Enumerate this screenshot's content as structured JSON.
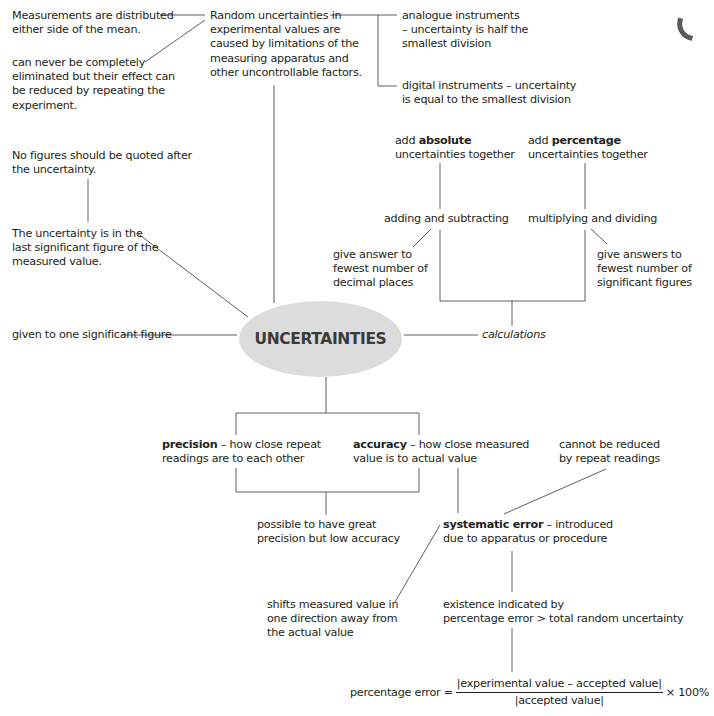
{
  "diagram": {
    "central_node": "UNCERTAINTIES",
    "top_left": {
      "distributed": [
        "Measurements are distributed",
        "either side of the mean."
      ],
      "never_eliminated": [
        "can never be completely",
        "eliminated but their effect can",
        "be reduced by repeating the",
        "experiment."
      ],
      "no_figures": [
        "No figures should be quoted after",
        "the uncertainty."
      ],
      "last_sig_fig": [
        "The uncertainty is in the",
        "last significant figure of the",
        "measured value."
      ],
      "one_sig_fig": "given to one significant figure"
    },
    "random": {
      "text": [
        "Random uncertainties in",
        "experimental values are",
        "caused by limitations of the",
        "measuring apparatus and",
        "other uncontrollable factors."
      ],
      "analogue": [
        "analogue instruments",
        "– uncertainty is half the",
        "smallest division"
      ],
      "digital": [
        "digital instruments – uncertainty",
        "is equal to the smallest division"
      ]
    },
    "calculations": {
      "label": "calculations",
      "absolute": {
        "pre": "add ",
        "bold": "absolute",
        "rest": "uncertainties together"
      },
      "percentage": {
        "pre": "add ",
        "bold": "percentage",
        "rest": "uncertainties together"
      },
      "adding": "adding and subtracting",
      "multiplying": "multiplying and dividing",
      "decimal_places": [
        "give answer to",
        "fewest number of",
        "decimal places"
      ],
      "sig_figs": [
        "give answers to",
        "fewest number of",
        "significant figures"
      ]
    },
    "precision": {
      "bold": "precision",
      "rest": " – how close repeat",
      "line2": "readings are to each other"
    },
    "accuracy": {
      "bold": "accuracy",
      "rest": " – how close measured",
      "line2": "value is to actual value"
    },
    "great_precision": [
      "possible to have great",
      "precision but low accuracy"
    ],
    "cannot_reduce": [
      "cannot be reduced",
      "by repeat readings"
    ],
    "systematic": {
      "bold": "systematic error",
      "rest": " – introduced",
      "line2": "due to apparatus or procedure"
    },
    "shifts": [
      "shifts measured value in",
      "one direction away from",
      "the actual value"
    ],
    "existence": [
      "existence indicated by",
      "percentage error > total random uncertainty"
    ],
    "formula": {
      "lhs": "percentage error =",
      "numerator": "|experimental value – accepted value|",
      "denominator": "|accepted value|",
      "multiplier": "× 100%"
    }
  }
}
